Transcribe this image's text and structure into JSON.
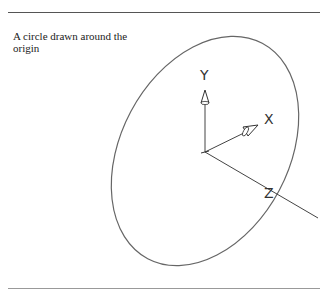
{
  "caption": "A circle drawn around the origin",
  "axes": {
    "x_label": "X",
    "y_label": "Y",
    "z_label": "Z"
  },
  "colors": {
    "line": "#555555",
    "text": "#222222"
  }
}
